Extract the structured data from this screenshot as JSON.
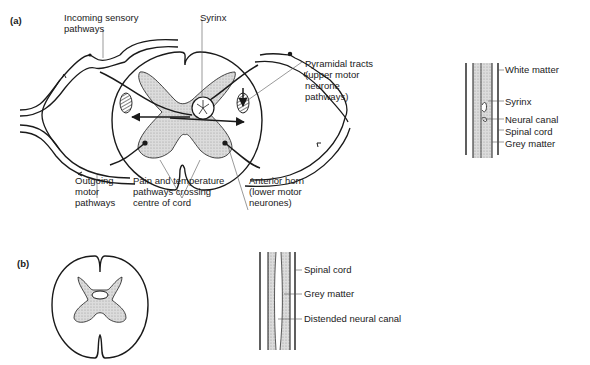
{
  "panels": {
    "a": {
      "label": "(a)",
      "cross_section_labels": {
        "incoming": "Incoming sensory\npathways",
        "syrinx": "Syrinx",
        "pyramidal": "Pyramidal tracts\n(upper motor\nneurone\npathways)",
        "outgoing": "Outgoing\nmotor\npathways",
        "pain": "Pain and temperature\npathways crossing\ncentre of cord",
        "anterior": "Anterior horn\n(lower motor\nneurones)"
      },
      "longitudinal_labels": {
        "white_matter": "White matter",
        "syrinx": "Syrinx",
        "neural_canal": "Neural canal",
        "spinal_cord": "Spinal cord",
        "grey_matter": "Grey matter"
      }
    },
    "b": {
      "label": "(b)",
      "longitudinal_labels": {
        "spinal_cord": "Spinal cord",
        "grey_matter": "Grey matter",
        "distended_canal": "Distended neural canal"
      }
    }
  },
  "colors": {
    "line": "#1a1a1a",
    "grey_fill": "#d4d4d4"
  }
}
